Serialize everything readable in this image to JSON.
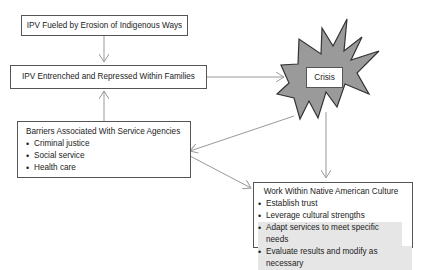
{
  "diagram": {
    "boxes": {
      "erosion": {
        "label": "IPV Fueled by Erosion of Indigenous Ways"
      },
      "entrenched": {
        "label": "IPV Entrenched and Repressed Within Families"
      },
      "crisis": {
        "label": "Crisis"
      },
      "barriers": {
        "title": "Barriers Associated With Service Agencies",
        "items": [
          "Criminal justice",
          "Social service",
          "Health care"
        ]
      },
      "native": {
        "title": "Work Within Native American Culture",
        "items": [
          "Establish trust",
          "Leverage cultural strengths",
          "Adapt services to meet specific needs",
          "Evaluate results and modify as necessary"
        ]
      }
    },
    "colors": {
      "burst_fill": "#9a9a9a",
      "burst_stroke": "#333333",
      "arrow": "#999999",
      "box_border": "#555555",
      "highlight": "#e6e6e6"
    }
  }
}
